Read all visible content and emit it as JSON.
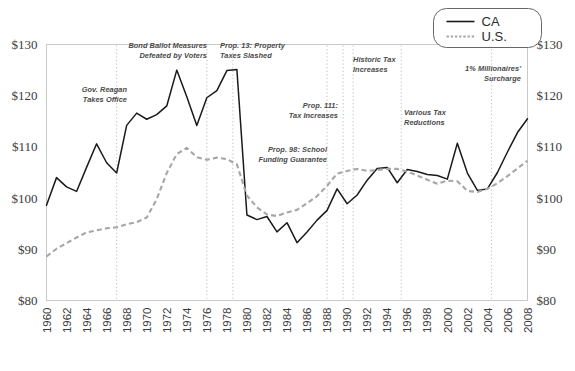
{
  "chart_data": {
    "type": "line",
    "title": "",
    "subtitle": "",
    "xlabel": "",
    "ylabel": "",
    "xlim": [
      1960,
      2008
    ],
    "ylim": [
      80,
      130
    ],
    "grid": false,
    "y_ticks": [
      "$80",
      "$90",
      "$100",
      "$110",
      "$120",
      "$130"
    ],
    "y_tick_values": [
      80,
      90,
      100,
      110,
      120,
      130
    ],
    "y_axis_right_mirrored": true,
    "x_ticks": [
      "1960",
      "1962",
      "1964",
      "1966",
      "1968",
      "1970",
      "1972",
      "1974",
      "1976",
      "1978",
      "1980",
      "1982",
      "1984",
      "1986",
      "1988",
      "1990",
      "1992",
      "1994",
      "1996",
      "1998",
      "2000",
      "2002",
      "2004",
      "2006",
      "2008"
    ],
    "x_tick_values": [
      1960,
      1962,
      1964,
      1966,
      1968,
      1970,
      1972,
      1974,
      1976,
      1978,
      1980,
      1982,
      1984,
      1986,
      1988,
      1990,
      1992,
      1994,
      1996,
      1998,
      2000,
      2002,
      2004,
      2006,
      2008
    ],
    "x_tick_rotation": -90,
    "legend": {
      "position": "top-right",
      "entries": [
        {
          "name": "CA",
          "style": "solid",
          "color": "#1a1a1a"
        },
        {
          "name": "U.S.",
          "style": "dotted",
          "color": "#a6a6a6"
        }
      ]
    },
    "x": [
      1960,
      1961,
      1962,
      1963,
      1964,
      1965,
      1966,
      1967,
      1968,
      1969,
      1970,
      1971,
      1972,
      1973,
      1974,
      1975,
      1976,
      1977,
      1978,
      1979,
      1980,
      1981,
      1982,
      1983,
      1984,
      1985,
      1986,
      1987,
      1988,
      1989,
      1990,
      1991,
      1992,
      1993,
      1994,
      1995,
      1996,
      1997,
      1998,
      1999,
      2000,
      2001,
      2002,
      2003,
      2004,
      2005,
      2006,
      2007,
      2008
    ],
    "series": [
      {
        "name": "CA",
        "color": "#1a1a1a",
        "style": "solid",
        "values": [
          98.6,
          104.0,
          102.2,
          101.3,
          106.0,
          110.6,
          106.9,
          104.9,
          114.2,
          116.6,
          115.4,
          116.3,
          118.0,
          125.0,
          119.8,
          114.2,
          119.6,
          121.0,
          124.9,
          125.1,
          96.7,
          95.8,
          96.4,
          93.4,
          95.2,
          91.3,
          93.4,
          95.7,
          97.6,
          101.8,
          98.9,
          100.6,
          103.5,
          105.8,
          106.0,
          103.0,
          105.6,
          105.2,
          104.6,
          104.4,
          103.7,
          110.7,
          104.9,
          101.5,
          101.8,
          105.0,
          109.0,
          112.8,
          115.5
        ]
      },
      {
        "name": "U.S.",
        "color": "#a6a6a6",
        "style": "dashed",
        "values": [
          88.6,
          90.1,
          91.2,
          92.3,
          93.3,
          93.7,
          94.1,
          94.3,
          94.9,
          95.3,
          96.2,
          99.8,
          104.9,
          108.6,
          109.8,
          108.0,
          107.5,
          107.9,
          107.6,
          106.6,
          100.5,
          98.2,
          96.8,
          96.5,
          97.2,
          97.7,
          99.0,
          100.4,
          102.4,
          104.8,
          105.3,
          105.7,
          105.3,
          105.5,
          105.7,
          105.7,
          105.2,
          104.4,
          103.6,
          102.8,
          103.4,
          103.3,
          101.4,
          101.2,
          101.8,
          102.9,
          104.3,
          105.8,
          107.3
        ]
      }
    ],
    "annotations": [
      {
        "id": "gov-reagan-takes-office",
        "label_lines": [
          "Gov. Reagan",
          "Takes Office"
        ],
        "year": 1967,
        "align": "right",
        "text_x": 127,
        "text_y": 92
      },
      {
        "id": "bond-ballot-measures",
        "label_lines": [
          "Bond Ballot Measures",
          "Defeated by Voters"
        ],
        "year": 1976,
        "align": "right",
        "text_x": 207,
        "text_y": 48
      },
      {
        "id": "prop-13-property-taxes-slashed",
        "label_lines": [
          "Prop. 13: Property",
          "Taxes Slashed"
        ],
        "year": 1978.6,
        "align": "left",
        "text_x": 220,
        "text_y": 48
      },
      {
        "id": "prop-98-school-funding-guarantee",
        "label_lines": [
          "Prop. 98: School",
          "Funding Guarantee"
        ],
        "year": 1988,
        "align": "right",
        "text_x": 327,
        "text_y": 152
      },
      {
        "id": "prop-111-tax-increases",
        "label_lines": [
          "Prop. 111:",
          "Tax Increases"
        ],
        "year": 1989.6,
        "align": "right",
        "text_x": 338,
        "text_y": 108
      },
      {
        "id": "historic-tax-increases",
        "label_lines": [
          "Historic Tax",
          "Increases"
        ],
        "year": 1990.6,
        "align": "left",
        "text_x": 353,
        "text_y": 62
      },
      {
        "id": "various-tax-reductions",
        "label_lines": [
          "Various Tax",
          "Reductions"
        ],
        "year": 1995.4,
        "align": "left",
        "text_x": 404,
        "text_y": 115
      },
      {
        "id": "one-percent-millionaires-surcharge",
        "label_lines": [
          "1% Millionaires'",
          "Surcharge"
        ],
        "year": 2004.4,
        "align": "right",
        "text_x": 521,
        "text_y": 71
      }
    ]
  },
  "legend_box": {
    "ca_label": "CA",
    "us_label": "U.S."
  }
}
